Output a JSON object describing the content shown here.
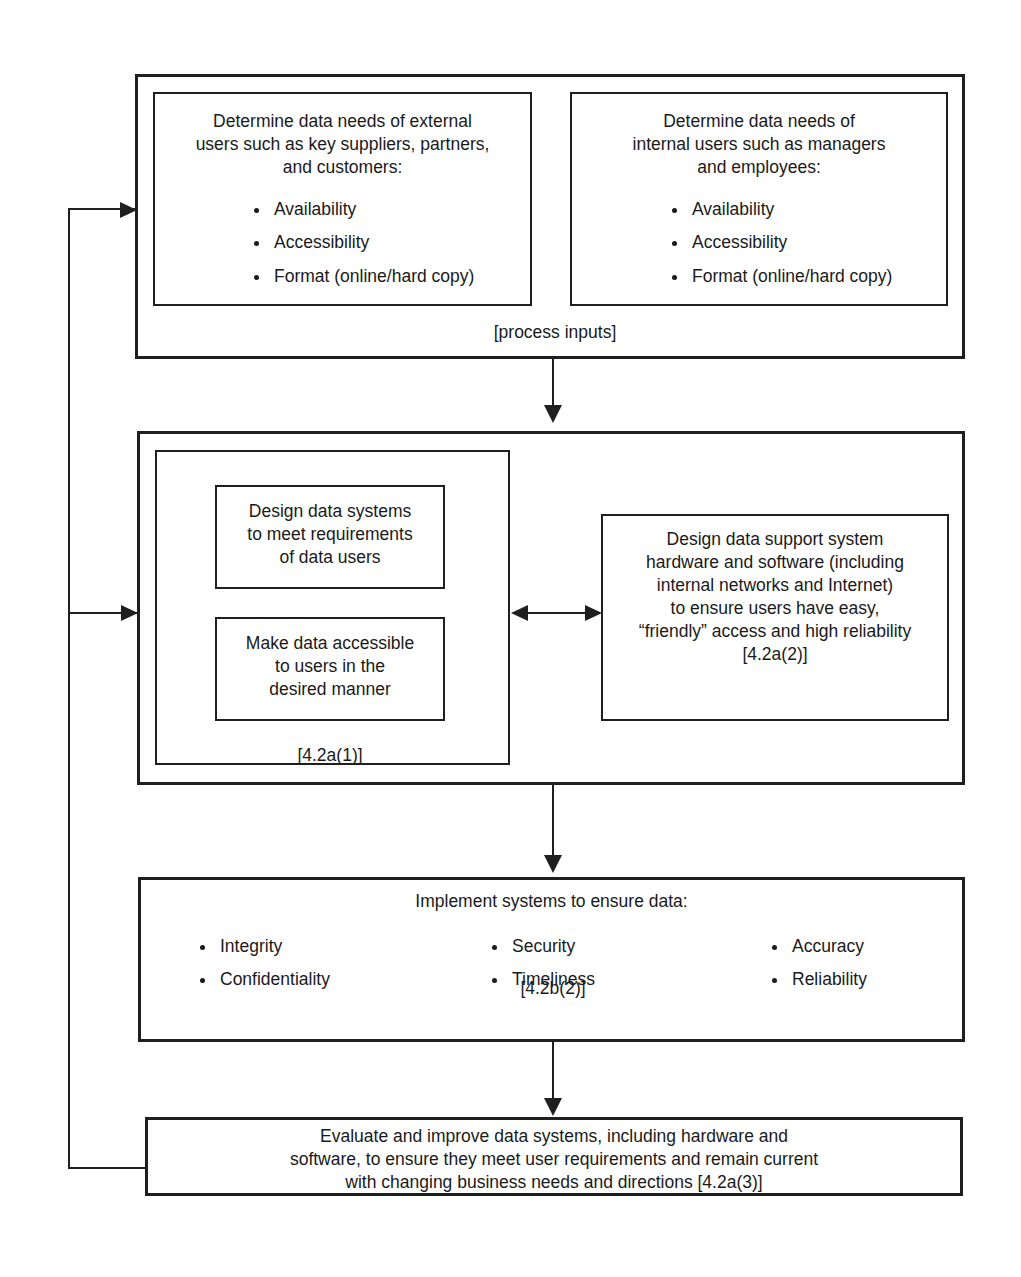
{
  "diagram": {
    "stages": {
      "inputs": {
        "caption": "[process inputs]",
        "external": {
          "heading": "Determine data needs of external\nusers such as key suppliers, partners,\nand customers:",
          "bullets": [
            "Availability",
            "Accessibility",
            "Format (online/hard copy)"
          ]
        },
        "internal": {
          "heading": "Determine data needs of\ninternal users such as managers\nand employees:",
          "bullets": [
            "Availability",
            "Accessibility",
            "Format (online/hard copy)"
          ]
        }
      },
      "design": {
        "reference": "[4.2a(1)]",
        "design_systems": "Design data systems\nto meet requirements\nof data users",
        "make_accessible": "Make data accessible\nto users in the\ndesired manner",
        "support_system": "Design data support system\nhardware and software (including\ninternal networks and Internet)\nto ensure users have easy,\n“friendly” access and high reliability\n[4.2a(2)]"
      },
      "implement": {
        "heading": "Implement systems to ensure data:",
        "reference": "[4.2b(2)]",
        "column1": [
          "Integrity",
          "Confidentiality"
        ],
        "column2": [
          "Security",
          "Timeliness"
        ],
        "column3": [
          "Accuracy",
          "Reliability"
        ]
      },
      "evaluate": {
        "text": "Evaluate and improve data systems, including hardware and\nsoftware, to ensure they meet user requirements and remain current\nwith changing business needs and directions [4.2a(3)]"
      }
    },
    "colors": {
      "stroke": "#1f1f1f",
      "text": "#1a1a1a",
      "background": "#ffffff"
    }
  }
}
